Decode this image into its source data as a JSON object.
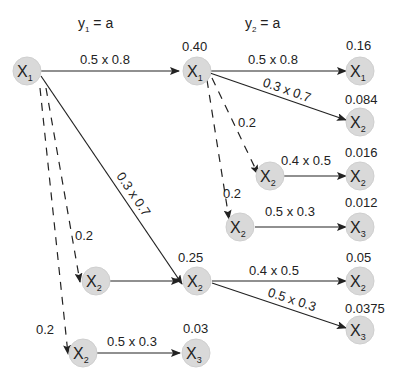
{
  "headers": [
    {
      "var": "y",
      "sub": "1",
      "rest": " = a"
    },
    {
      "var": "y",
      "sub": "2",
      "rest": " = a"
    }
  ],
  "nodes": {
    "root": {
      "var": "X",
      "sub": "1",
      "prob": ""
    },
    "s1_x1": {
      "var": "X",
      "sub": "1",
      "prob": "0.40"
    },
    "s1_x2_top": {
      "var": "X",
      "sub": "2",
      "prob": "0.25"
    },
    "s1_x2_left": {
      "var": "X",
      "sub": "2",
      "prob": ""
    },
    "s1_x2_bottom": {
      "var": "X",
      "sub": "2",
      "prob": ""
    },
    "s1_x3": {
      "var": "X",
      "sub": "3",
      "prob": "0.03"
    },
    "s2_x2_a": {
      "var": "X",
      "sub": "2",
      "prob": ""
    },
    "s2_x2_b": {
      "var": "X",
      "sub": "2",
      "prob": ""
    },
    "s2_out_1": {
      "var": "X",
      "sub": "1",
      "prob": "0.16"
    },
    "s2_out_2": {
      "var": "X",
      "sub": "2",
      "prob": "0.084"
    },
    "s2_out_3": {
      "var": "X",
      "sub": "2",
      "prob": "0.016"
    },
    "s2_out_4": {
      "var": "X",
      "sub": "3",
      "prob": "0.012"
    },
    "s2_out_5": {
      "var": "X",
      "sub": "2",
      "prob": "0.05"
    },
    "s2_out_6": {
      "var": "X",
      "sub": "3",
      "prob": "0.0375"
    }
  },
  "edges": {
    "root_to_x1": "0.5 x 0.8",
    "root_to_x2": "0.3 x 0.7",
    "root_dash_1": "0.2",
    "root_dash_2": "0.2",
    "bottom_x2_to_x3": "0.5 x 0.3",
    "x1_to_x1": "0.5 x 0.8",
    "x1_to_x2": "0.3 x 0.7",
    "x1_dash_1": "0.2",
    "x1_dash_2": "0.2",
    "x2a_to_x2": "0.4 x 0.5",
    "x2b_to_x3": "0.5 x 0.3",
    "x2_to_x2": "0.4 x 0.5",
    "x2_to_x3": "0.5 x 0.3"
  },
  "colors": {
    "node_fill": "#d9d9d9",
    "line": "#222222"
  }
}
